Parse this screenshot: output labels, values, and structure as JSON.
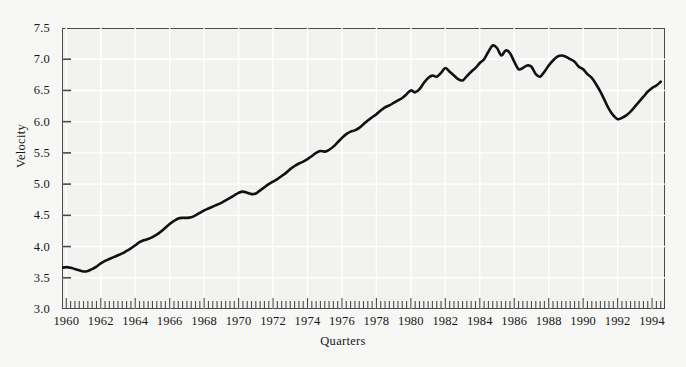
{
  "chart_data": {
    "type": "line",
    "title": "",
    "subtitle": "",
    "xlabel": "Quarters",
    "ylabel": "Velocity",
    "xlim": [
      1959.75,
      1994.75
    ],
    "ylim": [
      3.0,
      7.5
    ],
    "grid": true,
    "legend": null,
    "legend_position": "none",
    "x_tick_labels": [
      "1960",
      "1962",
      "1964",
      "1966",
      "1968",
      "1970",
      "1972",
      "1974",
      "1976",
      "1978",
      "1980",
      "1982",
      "1984",
      "1986",
      "1988",
      "1990",
      "1992",
      "1994"
    ],
    "x_tick_values": [
      1960,
      1962,
      1964,
      1966,
      1968,
      1970,
      1972,
      1974,
      1976,
      1978,
      1980,
      1982,
      1984,
      1986,
      1988,
      1990,
      1992,
      1994
    ],
    "x_minor_tick_interval": 0.25,
    "y_tick_labels": [
      "7.5",
      "7.0",
      "6.5",
      "6.0",
      "5.5",
      "5.0",
      "4.5",
      "4.0",
      "3.5",
      "3.0"
    ],
    "y_tick_values": [
      7.5,
      7.0,
      6.5,
      6.0,
      5.5,
      5.0,
      4.5,
      4.0,
      3.5,
      3.0
    ],
    "series": [
      {
        "name": "Velocity",
        "color": "#111111",
        "line_width": 2.6,
        "x": [
          1959.75,
          1960.0,
          1960.25,
          1960.5,
          1960.75,
          1961.0,
          1961.25,
          1961.5,
          1961.75,
          1962.0,
          1962.25,
          1962.5,
          1962.75,
          1963.0,
          1963.25,
          1963.5,
          1963.75,
          1964.0,
          1964.25,
          1964.5,
          1964.75,
          1965.0,
          1965.25,
          1965.5,
          1965.75,
          1966.0,
          1966.25,
          1966.5,
          1966.75,
          1967.0,
          1967.25,
          1967.5,
          1967.75,
          1968.0,
          1968.25,
          1968.5,
          1968.75,
          1969.0,
          1969.25,
          1969.5,
          1969.75,
          1970.0,
          1970.25,
          1970.5,
          1970.75,
          1971.0,
          1971.25,
          1971.5,
          1971.75,
          1972.0,
          1972.25,
          1972.5,
          1972.75,
          1973.0,
          1973.25,
          1973.5,
          1973.75,
          1974.0,
          1974.25,
          1974.5,
          1974.75,
          1975.0,
          1975.25,
          1975.5,
          1975.75,
          1976.0,
          1976.25,
          1976.5,
          1976.75,
          1977.0,
          1977.25,
          1977.5,
          1977.75,
          1978.0,
          1978.25,
          1978.5,
          1978.75,
          1979.0,
          1979.25,
          1979.5,
          1979.75,
          1980.0,
          1980.25,
          1980.5,
          1980.75,
          1981.0,
          1981.25,
          1981.5,
          1981.75,
          1982.0,
          1982.25,
          1982.5,
          1982.75,
          1983.0,
          1983.25,
          1983.5,
          1983.75,
          1984.0,
          1984.25,
          1984.5,
          1984.75,
          1985.0,
          1985.25,
          1985.5,
          1985.75,
          1986.0,
          1986.25,
          1986.5,
          1986.75,
          1987.0,
          1987.25,
          1987.5,
          1987.75,
          1988.0,
          1988.25,
          1988.5,
          1988.75,
          1989.0,
          1989.25,
          1989.5,
          1989.75,
          1990.0,
          1990.25,
          1990.5,
          1990.75,
          1991.0,
          1991.25,
          1991.5,
          1991.75,
          1992.0,
          1992.25,
          1992.5,
          1992.75,
          1993.0,
          1993.25,
          1993.5,
          1993.75,
          1994.0,
          1994.25,
          1994.5
        ],
        "y": [
          3.66,
          3.67,
          3.66,
          3.64,
          3.62,
          3.6,
          3.61,
          3.64,
          3.68,
          3.73,
          3.77,
          3.8,
          3.83,
          3.86,
          3.89,
          3.93,
          3.97,
          4.02,
          4.07,
          4.1,
          4.12,
          4.15,
          4.19,
          4.24,
          4.3,
          4.36,
          4.41,
          4.45,
          4.46,
          4.46,
          4.47,
          4.5,
          4.54,
          4.58,
          4.61,
          4.64,
          4.67,
          4.7,
          4.74,
          4.78,
          4.82,
          4.86,
          4.88,
          4.86,
          4.84,
          4.85,
          4.9,
          4.95,
          5.0,
          5.04,
          5.08,
          5.13,
          5.18,
          5.24,
          5.29,
          5.33,
          5.36,
          5.4,
          5.45,
          5.5,
          5.53,
          5.52,
          5.55,
          5.6,
          5.67,
          5.74,
          5.8,
          5.84,
          5.86,
          5.9,
          5.96,
          6.02,
          6.07,
          6.12,
          6.18,
          6.23,
          6.26,
          6.3,
          6.34,
          6.38,
          6.44,
          6.5,
          6.47,
          6.52,
          6.62,
          6.7,
          6.74,
          6.72,
          6.78,
          6.86,
          6.8,
          6.74,
          6.68,
          6.66,
          6.73,
          6.8,
          6.86,
          6.94,
          7.0,
          7.12,
          7.22,
          7.18,
          7.06,
          7.14,
          7.1,
          6.96,
          6.84,
          6.86,
          6.9,
          6.88,
          6.76,
          6.72,
          6.8,
          6.9,
          6.98,
          7.04,
          7.06,
          7.04,
          7.0,
          6.96,
          6.88,
          6.84,
          6.76,
          6.7,
          6.6,
          6.48,
          6.34,
          6.2,
          6.1,
          6.04,
          6.06,
          6.1,
          6.16,
          6.24,
          6.32,
          6.4,
          6.48,
          6.54,
          6.58,
          6.64
        ]
      }
    ],
    "annotations": []
  },
  "axes": {
    "y_title": "Velocity",
    "x_title": "Quarters"
  },
  "style": {
    "background_color": "#f7f7f5",
    "plot_background_color": "#f2f2f0",
    "grid_color": "#ffffff",
    "frame_color": "#4a4a4a",
    "line_color": "#111111",
    "text_color": "#161616"
  }
}
